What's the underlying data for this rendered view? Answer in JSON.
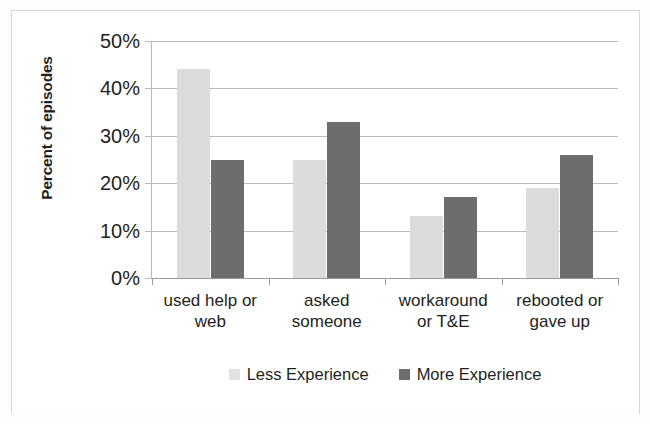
{
  "chart_data": {
    "type": "bar",
    "title": "",
    "xlabel": "",
    "ylabel": "Percent of episodes",
    "ylim": [
      0,
      50
    ],
    "ytick_labels": [
      "50%",
      "40%",
      "30%",
      "20%",
      "10%",
      "0%"
    ],
    "ytick_values": [
      50,
      40,
      30,
      20,
      10,
      0
    ],
    "grid": true,
    "legend_position": "bottom",
    "categories": [
      "used help or web",
      "asked someone",
      "workaround or T&E",
      "rebooted or gave up"
    ],
    "category_lines": [
      [
        "used help or",
        "web"
      ],
      [
        "asked",
        "someone"
      ],
      [
        "workaround",
        "or T&E"
      ],
      [
        "rebooted or",
        "gave up"
      ]
    ],
    "series": [
      {
        "name": "Less Experience",
        "color": "#dcdcdc",
        "values": [
          44,
          25,
          13,
          19
        ]
      },
      {
        "name": "More Experience",
        "color": "#6d6d6d",
        "values": [
          25,
          33,
          17,
          26
        ]
      }
    ]
  },
  "axis": {
    "y_title": "Percent of episodes"
  },
  "legend": {
    "items": [
      {
        "label": "Less Experience",
        "swatch": "legend-swatch-less-experience"
      },
      {
        "label": "More Experience",
        "swatch": "legend-swatch-more-experience"
      }
    ]
  }
}
